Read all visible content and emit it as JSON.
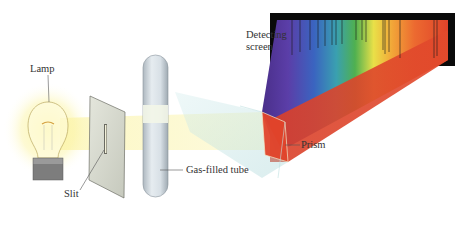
{
  "diagram": {
    "labels": {
      "lamp": "Lamp",
      "slit": "Slit",
      "gas_tube": "Gas-filled tube",
      "prism": "Prism",
      "screen_line1": "Detecting",
      "screen_line2": "screen"
    },
    "components": [
      "lamp",
      "slit",
      "gas-filled-tube",
      "prism",
      "detecting-screen"
    ],
    "colors": {
      "light_beam": "#fdf7b0",
      "screen_background": "#000000",
      "spectrum_red": "#e0452a",
      "spectrum_orange": "#f08a2c",
      "spectrum_yellow": "#f2e24a",
      "spectrum_green": "#4caa4c",
      "spectrum_blue": "#3a6cc0",
      "spectrum_violet": "#5a3a9a",
      "prism_glass": "#bfe3e3",
      "tube_glass": "#d6dfe6"
    }
  }
}
